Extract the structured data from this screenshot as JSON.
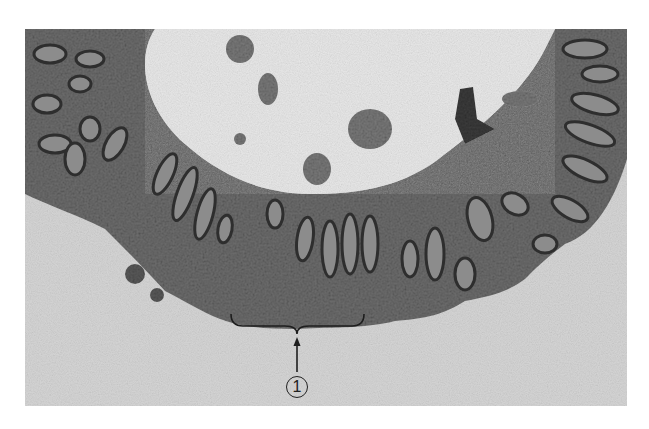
{
  "figure": {
    "annotations": [
      {
        "id": "label-1",
        "text": "1",
        "style": "circled-number",
        "pointer": "arrow pointing up to curly brace spanning a region of the mucosa"
      }
    ],
    "colors": {
      "background": "#ffffff",
      "lumen": "#e6e6e6",
      "tissue": "#6a6a6a",
      "crypt_dark": "#3a3a3a",
      "crypt_light": "#9a9a9a",
      "below_tissue": "#d8d8d8"
    }
  }
}
